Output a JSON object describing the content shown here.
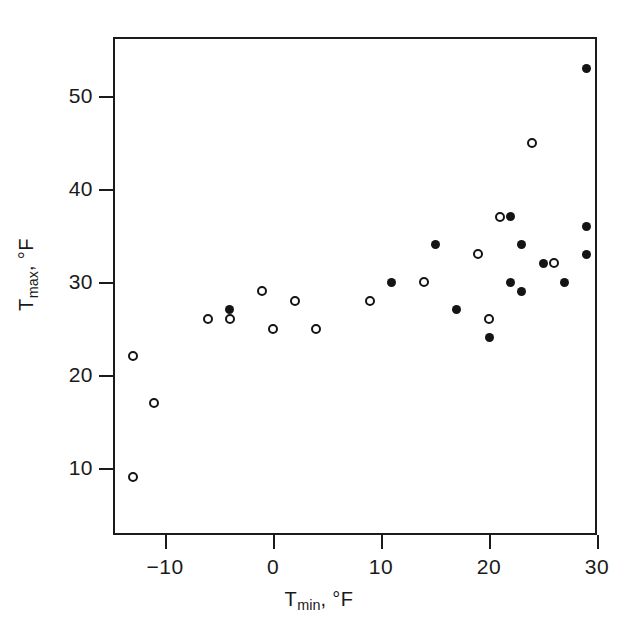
{
  "chart_data": {
    "type": "scatter",
    "title": "",
    "xlabel": "T_min, °F",
    "ylabel": "T_max, °F",
    "xlim": [
      -14.8,
      30
    ],
    "ylim": [
      7.3,
      53.6
    ],
    "xticks": [
      -10,
      0,
      10,
      20,
      30
    ],
    "xticklabels": [
      "-10",
      "0",
      "10",
      "20",
      "30"
    ],
    "yticks": [
      10,
      20,
      30,
      40,
      50
    ],
    "yticklabels": [
      "10",
      "20",
      "30",
      "40",
      "50"
    ],
    "grid": false,
    "legend": null,
    "marker_colors": {
      "filled": "#141414",
      "open_edge": "#141414",
      "open_face": "#ffffff"
    },
    "series": [
      {
        "name": "open circles",
        "marker": "open",
        "points": [
          {
            "x": -13,
            "y": 22
          },
          {
            "x": -13,
            "y": 9
          },
          {
            "x": -11,
            "y": 17
          },
          {
            "x": -6,
            "y": 26
          },
          {
            "x": -4,
            "y": 26
          },
          {
            "x": -1,
            "y": 29
          },
          {
            "x": 0,
            "y": 25
          },
          {
            "x": 2,
            "y": 28
          },
          {
            "x": 4,
            "y": 25
          },
          {
            "x": 9,
            "y": 28
          },
          {
            "x": 14,
            "y": 30
          },
          {
            "x": 19,
            "y": 33
          },
          {
            "x": 20,
            "y": 26
          },
          {
            "x": 21,
            "y": 37
          },
          {
            "x": 24,
            "y": 45
          },
          {
            "x": 26,
            "y": 32
          }
        ]
      },
      {
        "name": "filled circles",
        "marker": "filled",
        "points": [
          {
            "x": -4,
            "y": 27
          },
          {
            "x": 11,
            "y": 30
          },
          {
            "x": 15,
            "y": 34
          },
          {
            "x": 17,
            "y": 27
          },
          {
            "x": 20,
            "y": 24
          },
          {
            "x": 22,
            "y": 37
          },
          {
            "x": 22,
            "y": 30
          },
          {
            "x": 23,
            "y": 34
          },
          {
            "x": 23,
            "y": 29
          },
          {
            "x": 25,
            "y": 32
          },
          {
            "x": 27,
            "y": 30
          },
          {
            "x": 29,
            "y": 53
          },
          {
            "x": 29,
            "y": 36
          },
          {
            "x": 29,
            "y": 33
          }
        ]
      }
    ]
  },
  "axis_titles": {
    "x_main": "T",
    "x_sub": "min",
    "x_rest": ", °F",
    "y_main": "T",
    "y_sub": "max",
    "y_rest": ", °F"
  }
}
